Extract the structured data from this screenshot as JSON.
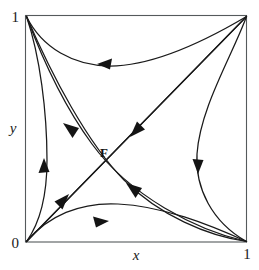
{
  "figure": {
    "kind": "phase-portrait",
    "title": "",
    "domain_box": {
      "x_min": 0,
      "x_max": 1,
      "y_min": 0,
      "y_max": 1
    },
    "axes": {
      "x_label": "x",
      "y_label": "y",
      "x_ticks": [
        "0",
        "1"
      ],
      "y_ticks": [
        "0",
        "1"
      ],
      "origin_label": "0",
      "x_max_label": "1",
      "y_max_label": "1"
    },
    "annotations": [
      {
        "name": "fixed-point-F",
        "label": "F",
        "x": 0.33,
        "y": 0.5
      }
    ],
    "colors": {
      "curve": "#1a1a1a",
      "frame": "#555a5c",
      "arrow": "#141414",
      "background": "#ffffff",
      "text": "#1a1a1a"
    },
    "corners": [
      {
        "name": "origin",
        "label": "0",
        "x": 0,
        "y": 0
      },
      {
        "name": "bottom-right",
        "label": "1",
        "x": 1,
        "y": 0
      },
      {
        "name": "top-left",
        "label": "1",
        "x": 0,
        "y": 1
      },
      {
        "name": "top-right",
        "label": "",
        "x": 1,
        "y": 1
      }
    ],
    "trajectories": [
      {
        "name": "top-edge-curve",
        "from": "top-right",
        "to": "top-left",
        "arrow_direction": "left"
      },
      {
        "name": "bottom-edge-curve",
        "from": "origin",
        "to": "bottom-right",
        "arrow_direction": "right"
      },
      {
        "name": "left-edge-curve",
        "from": "origin",
        "to": "top-left",
        "arrow_direction": "up"
      },
      {
        "name": "right-edge-curve",
        "from": "top-right",
        "to": "bottom-right",
        "arrow_direction": "down"
      },
      {
        "name": "main-diagonal",
        "from": "origin",
        "to": "top-right",
        "arrow_direction": "up-right"
      },
      {
        "name": "anti-diagonal-in",
        "from": "top-right",
        "to": "origin",
        "arrow_direction": "down-left"
      },
      {
        "name": "separatrix-upper",
        "from": "bottom-right",
        "to": "top-left",
        "arrow_direction": "up-left"
      },
      {
        "name": "separatrix-lower",
        "from": "bottom-right",
        "to": "top-left",
        "arrow_direction": "up-left"
      }
    ]
  }
}
